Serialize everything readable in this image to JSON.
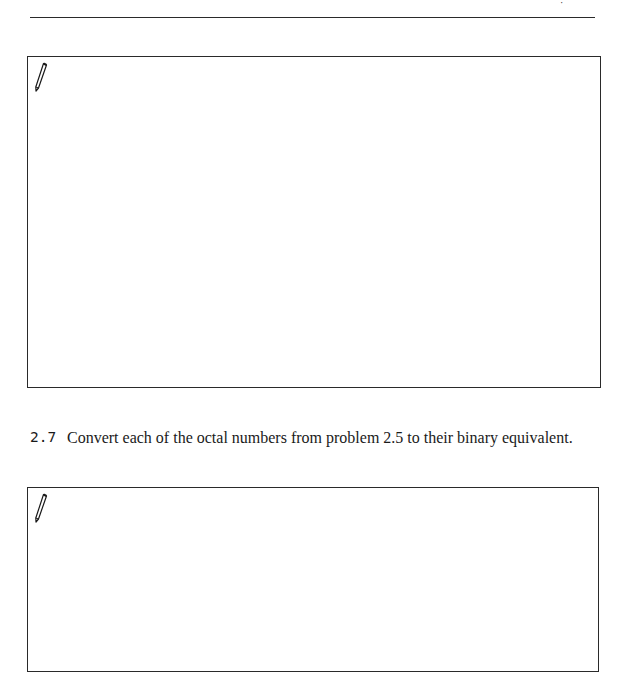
{
  "header": {
    "fragment_text": "·"
  },
  "answer_boxes": [
    {
      "icon": "pencil-icon",
      "content": ""
    },
    {
      "icon": "pencil-icon",
      "content": ""
    }
  ],
  "problems": [
    {
      "number": "2.7",
      "text": "Convert each of the octal numbers from problem 2.5 to their binary equivalent."
    }
  ],
  "colors": {
    "ink": "#1a1a1a",
    "rule": "#2a2a2a",
    "paper": "#ffffff"
  }
}
